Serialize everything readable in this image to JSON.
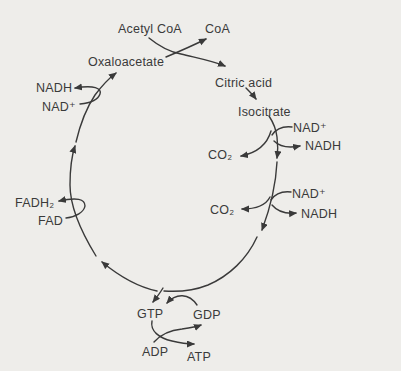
{
  "colors": {
    "background": "#eeedea",
    "ink": "#3a3a3a"
  },
  "diagram": {
    "type": "metabolic-cycle",
    "cycle_direction": "clockwise"
  },
  "labels": {
    "acetyl_coa": "Acetyl CoA",
    "coa": "CoA",
    "oxaloacetate": "Oxaloacetate",
    "citric_acid": "Citric acid",
    "isocitrate": "Isocitrate",
    "nadh_left": "NADH",
    "nad_left": "NAD⁺",
    "fadh2": "FADH₂",
    "fad": "FAD",
    "nad_right_1": "NAD⁺",
    "nadh_right_1": "NADH",
    "co2_1": "CO₂",
    "nad_right_2": "NAD⁺",
    "nadh_right_2": "NADH",
    "co2_2": "CO₂",
    "gtp": "GTP",
    "gdp": "GDP",
    "adp": "ADP",
    "atp": "ATP"
  }
}
